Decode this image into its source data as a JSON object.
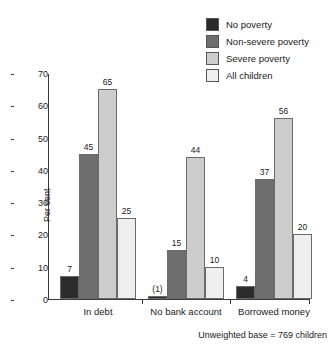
{
  "chart_data": {
    "type": "bar",
    "title": "",
    "xlabel": "",
    "ylabel": "Per cent",
    "ylim": [
      0,
      70
    ],
    "yticks": [
      0,
      10,
      20,
      30,
      40,
      50,
      60,
      70
    ],
    "grid": false,
    "legend_position": "top-right",
    "categories": [
      "In debt",
      "No bank account",
      "Borrowed money"
    ],
    "series": [
      {
        "name": "No poverty",
        "color": "#2b2b2b",
        "values": [
          7,
          1,
          4
        ],
        "labels": [
          "7",
          "(1)",
          "4"
        ]
      },
      {
        "name": "Non-severe poverty",
        "color": "#6e6e6e",
        "values": [
          45,
          15,
          37
        ],
        "labels": [
          "45",
          "15",
          "37"
        ]
      },
      {
        "name": "Severe poverty",
        "color": "#cdcdcd",
        "values": [
          65,
          44,
          56
        ],
        "labels": [
          "65",
          "44",
          "56"
        ]
      },
      {
        "name": "All children",
        "color": "#efefef",
        "values": [
          25,
          10,
          20
        ],
        "labels": [
          "25",
          "10",
          "20"
        ]
      }
    ],
    "footnote": "Unweighted base = 769 children"
  }
}
